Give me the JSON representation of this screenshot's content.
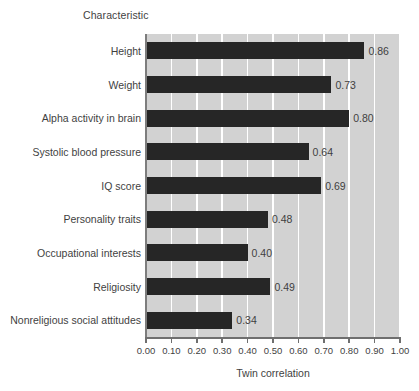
{
  "chart_data": {
    "type": "bar",
    "orientation": "horizontal",
    "title": "Characteristic",
    "xlabel": "Twin correlation",
    "ylabel": "Characteristic",
    "xlim": [
      0.0,
      1.0
    ],
    "grid": true,
    "legend": false,
    "categories": [
      "Height",
      "Weight",
      "Alpha activity in brain",
      "Systolic blood pressure",
      "IQ score",
      "Personality traits",
      "Occupational interests",
      "Religiosity",
      "Nonreligious social attitudes"
    ],
    "values": [
      0.86,
      0.73,
      0.8,
      0.64,
      0.69,
      0.48,
      0.4,
      0.49,
      0.34
    ],
    "value_labels": [
      "0.86",
      "0.73",
      "0.80",
      "0.64",
      "0.69",
      "0.48",
      "0.40",
      "0.49",
      "0.34"
    ],
    "xticks": [
      0.0,
      0.1,
      0.2,
      0.3,
      0.4,
      0.5,
      0.6,
      0.7,
      0.8,
      0.9,
      1.0
    ],
    "xtick_labels": [
      "0.00",
      "0.10",
      "0.20",
      "0.30",
      "0.40",
      "0.50",
      "0.60",
      "0.70",
      "0.80",
      "0.90",
      "1.00"
    ],
    "colors": {
      "bar": "#262626",
      "plot_background": "#d2d2d2",
      "gridline": "#ffffff",
      "axis": "#6f6f6f",
      "text": "#3f3f3f",
      "page_background": "#ffffff"
    }
  }
}
